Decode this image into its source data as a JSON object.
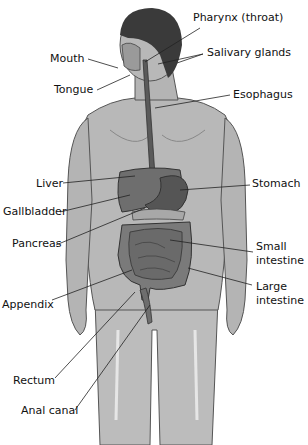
{
  "diagram": {
    "labels": {
      "pharynx": "Pharynx (throat)",
      "mouth": "Mouth",
      "salivary": "Salivary glands",
      "tongue": "Tongue",
      "esophagus": "Esophagus",
      "liver": "Liver",
      "stomach": "Stomach",
      "gallbladder": "Gallbladder",
      "pancreas": "Pancreas",
      "small_intestine_1": "Small",
      "small_intestine_2": "intestine",
      "large_intestine_1": "Large",
      "large_intestine_2": "intestine",
      "appendix": "Appendix",
      "rectum": "Rectum",
      "anal_canal": "Anal canal"
    },
    "colors": {
      "skin": "#b4b4b4",
      "skin_light": "#d2d2d2",
      "hair": "#3a3a3a",
      "liver": "#6e6e6e",
      "stomach": "#555555",
      "intestine": "#7a7a7a",
      "esophagus": "#5a5a5a",
      "leader_line": "#222222"
    }
  }
}
